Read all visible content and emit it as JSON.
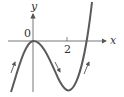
{
  "diagram": {
    "type": "function-graph",
    "axes": {
      "x_label": "x",
      "y_label": "y",
      "origin_label": "0",
      "x_tick_labels": [
        "2"
      ]
    },
    "curve": {
      "color": "#5a5a5a",
      "local_max": {
        "x": 0,
        "y": 0
      },
      "local_min_x": 2,
      "direction_arrows": [
        "increasing-left",
        "decreasing-middle",
        "increasing-right"
      ]
    },
    "colors": {
      "axis": "#555555",
      "curve": "#5a5a5a",
      "text": "#333333"
    }
  }
}
